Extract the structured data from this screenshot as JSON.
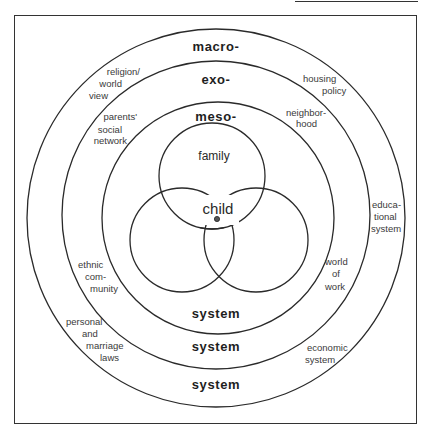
{
  "diagram": {
    "type": "nested-ecological-systems",
    "rings": {
      "macro": {
        "label": "macro-",
        "bottom_label": "system"
      },
      "exo": {
        "label": "exo-",
        "bottom_label": "system"
      },
      "meso": {
        "label": "meso-",
        "bottom_label": "system"
      }
    },
    "micro": {
      "top_circle_label": "family",
      "center_label": "child"
    },
    "macro_ring_labels": {
      "religion": [
        "religion/",
        "world",
        "view"
      ],
      "housing": [
        "housing",
        "policy"
      ],
      "education": [
        "educa-",
        "tional",
        "system"
      ],
      "laws": [
        "personal",
        "and",
        "marriage",
        "laws"
      ],
      "economic": [
        "economic",
        "system"
      ]
    },
    "exo_ring_labels": {
      "parents_network": [
        "parents'",
        "social",
        "network"
      ],
      "neighborhood": [
        "neighbor-",
        "hood"
      ],
      "work": [
        "world",
        "of",
        "work"
      ],
      "ethnic": [
        "ethnic",
        "com-",
        "munity"
      ]
    },
    "colors": {
      "line": "#2a2a2a",
      "text": "#1e1e1e",
      "background": "#ffffff"
    }
  }
}
